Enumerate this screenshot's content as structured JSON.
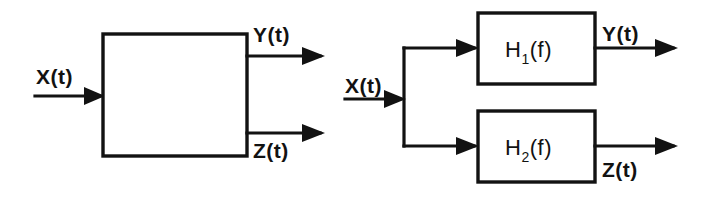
{
  "figure": {
    "background_color": "#ffffff",
    "line_color": "#121212",
    "diagrams": [
      {
        "id": "left",
        "name": "single-block-two-output-system",
        "block": {
          "label": "",
          "x": 103,
          "y": 34,
          "width": 144,
          "height": 122
        },
        "input": {
          "label": "X(t)",
          "label_x": 36,
          "label_y": 84,
          "line_y": 96
        },
        "outputs": [
          {
            "label": "Y(t)",
            "label_x": 253,
            "label_y": 42,
            "line_y": 56,
            "position": "above-line"
          },
          {
            "label": "Z(t)",
            "label_x": 253,
            "label_y": 158,
            "line_y": 133,
            "position": "below-line"
          }
        ]
      },
      {
        "id": "right",
        "name": "parallel-filter-bank",
        "input": {
          "label": "X(t)",
          "label_x": 345,
          "label_y": 93,
          "line_y": 99
        },
        "branch_x": 404,
        "blocks": [
          {
            "label": "H",
            "subscript": "1",
            "suffix": "(f)",
            "full_label": "H1(f)",
            "x": 478,
            "y": 13,
            "width": 117,
            "height": 71,
            "output": {
              "label": "Y(t)",
              "label_x": 602,
              "label_y": 41,
              "line_y": 48,
              "position": "above-line"
            }
          },
          {
            "label": "H",
            "subscript": "2",
            "suffix": "(f)",
            "full_label": "H2(f)",
            "x": 478,
            "y": 111,
            "width": 117,
            "height": 71,
            "output": {
              "label": "Z(t)",
              "label_x": 602,
              "label_y": 177,
              "line_y": 146,
              "position": "below-line"
            }
          }
        ]
      }
    ]
  }
}
